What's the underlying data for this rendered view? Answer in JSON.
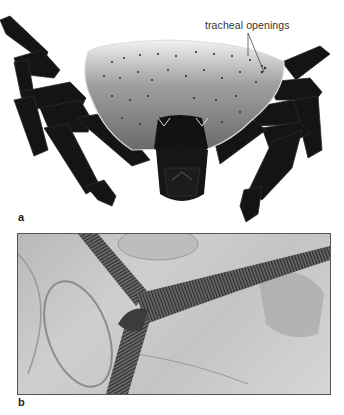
{
  "figure": {
    "panels": [
      {
        "label": "a",
        "description": "Scanning electron micrograph of a mite/tick (dorsal-frontal view) showing body shield and legs",
        "annotations": [
          {
            "text": "tracheal openings",
            "pointer_count": 2
          }
        ]
      },
      {
        "label": "b",
        "description": "Light micrograph of branching ringed tracheal tubes"
      }
    ],
    "colors": {
      "background": "#ffffff",
      "specimen_dark": "#111111",
      "shield_gray": "#8a8a8a",
      "micrograph_gray": "#c4c4c4",
      "trachea_dark": "#3a3a3a",
      "frame": "#555555"
    }
  }
}
